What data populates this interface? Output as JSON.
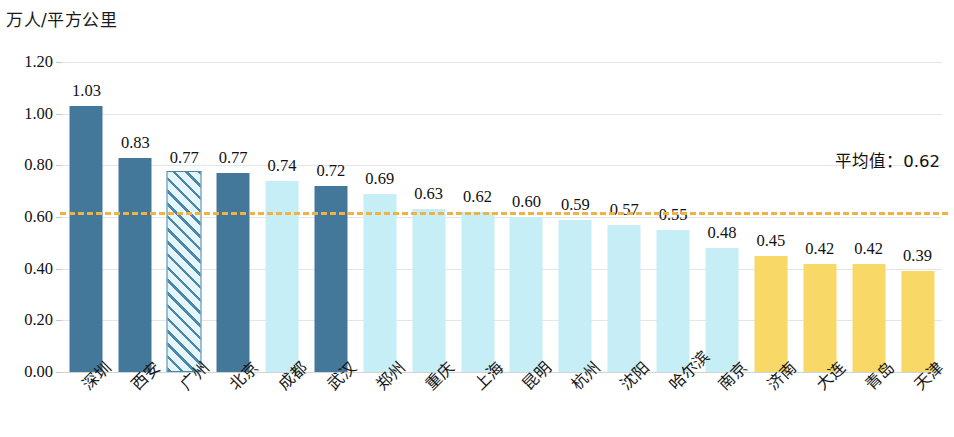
{
  "chart_data": {
    "type": "bar",
    "title": "",
    "subtitle": "",
    "ylabel": "万人/平方公里",
    "xlabel": "",
    "ylim": [
      0.0,
      1.2
    ],
    "ytick_labels": [
      "1.20",
      "1.00",
      "0.80",
      "0.60",
      "0.40",
      "0.20",
      "0.00"
    ],
    "ytick_values": [
      1.2,
      1.0,
      0.8,
      0.6,
      0.4,
      0.2,
      0.0
    ],
    "grid": true,
    "legend": "none",
    "categories": [
      "深圳",
      "西安",
      "广州",
      "北京",
      "成都",
      "武汉",
      "郑州",
      "重庆",
      "上海",
      "昆明",
      "杭州",
      "沈阳",
      "哈尔滨",
      "南京",
      "济南",
      "大连",
      "青岛",
      "天津"
    ],
    "values": [
      1.03,
      0.83,
      0.77,
      0.77,
      0.74,
      0.72,
      0.69,
      0.63,
      0.62,
      0.6,
      0.59,
      0.57,
      0.55,
      0.48,
      0.45,
      0.42,
      0.42,
      0.39
    ],
    "value_labels": [
      "1.03",
      "0.83",
      "0.77",
      "0.77",
      "0.74",
      "0.72",
      "0.69",
      "0.63",
      "0.62",
      "0.60",
      "0.59",
      "0.57",
      "0.55",
      "0.48",
      "0.45",
      "0.42",
      "0.42",
      "0.39"
    ],
    "bar_styles": [
      "dark",
      "dark",
      "hatch",
      "dark",
      "light",
      "dark",
      "light",
      "light",
      "light",
      "light",
      "light",
      "light",
      "light",
      "light",
      "yellow",
      "yellow",
      "yellow",
      "yellow"
    ],
    "annotations": [
      {
        "name": "average-line",
        "label": "平均值：0.62",
        "value": 0.62,
        "style": "dashed"
      }
    ],
    "colors": {
      "dark_blue": "#43789b",
      "light_cyan": "#c6eef6",
      "yellow": "#f8d866",
      "hatch_stroke": "#4d87a8",
      "hatch_fill": "#e4f6fb",
      "average_line": "#efb244",
      "gridline": "#e3e6e8",
      "text": "#111111"
    }
  }
}
